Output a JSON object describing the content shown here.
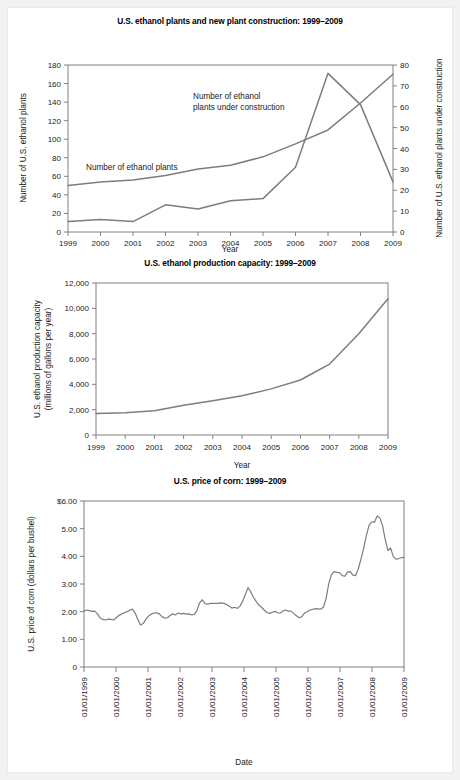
{
  "page": {
    "background": "#f2f2f2",
    "sheet_background": "#ffffff",
    "line_color": "#7d7d7d",
    "axis_color": "#808080"
  },
  "figures": [
    {
      "id": "plants",
      "title": "U.S. ethanol plants and new plant construction: 1999–2009",
      "xlabel": "Year",
      "ylabel_left": "Number of U.S. ethanol plants",
      "ylabel_right": "Number of U.S. ethanol plants under construction",
      "annotation_plants": "Number of ethanol plants",
      "annotation_construction_line1": "Number of ethanol",
      "annotation_construction_line2": "plants under construction",
      "xticks": [
        "1999",
        "2000",
        "2001",
        "2002",
        "2003",
        "2004",
        "2005",
        "2006",
        "2007",
        "2008",
        "2009"
      ],
      "yticks_left": [
        "0",
        "20",
        "40",
        "60",
        "80",
        "100",
        "120",
        "140",
        "160",
        "180"
      ],
      "yticks_right": [
        "0",
        "10",
        "20",
        "30",
        "40",
        "50",
        "60",
        "70",
        "80"
      ]
    },
    {
      "id": "capacity",
      "title": "U.S. ethanol production capacity: 1999–2009",
      "xlabel": "Year",
      "ylabel_line1": "U.S. ethanol production capacity",
      "ylabel_line2": "(millions of gallons per year)",
      "xticks": [
        "1999",
        "2000",
        "2001",
        "2002",
        "2003",
        "2004",
        "2005",
        "2006",
        "2007",
        "2008",
        "2009"
      ],
      "yticks": [
        "0",
        "2,000",
        "4,000",
        "6,000",
        "8,000",
        "10,000",
        "12,000"
      ]
    },
    {
      "id": "corn",
      "title": "U.S. price of corn: 1999–2009",
      "xlabel": "Date",
      "ylabel": "U.S. price of corn (dollars per bushel)",
      "xticks": [
        "01/01/1999",
        "01/01/2000",
        "01/01/2001",
        "01/01/2002",
        "01/01/2003",
        "01/01/2004",
        "01/01/2005",
        "01/01/2006",
        "01/01/2007",
        "01/01/2008",
        "01/01/2009"
      ],
      "yticks": [
        "0",
        "1.00",
        "2.00",
        "3.00",
        "4.00",
        "5.00",
        "$6.00"
      ]
    }
  ],
  "chart_data": [
    {
      "type": "line",
      "id": "plants",
      "title": "U.S. ethanol plants and new plant construction: 1999–2009",
      "xlabel": "Year",
      "ylabel": "Number of U.S. ethanol plants",
      "ylabel_secondary": "Number of U.S. ethanol plants under construction",
      "x": [
        1999,
        2000,
        2001,
        2002,
        2003,
        2004,
        2005,
        2006,
        2007,
        2008,
        2009
      ],
      "xlim": [
        1999,
        2009
      ],
      "ylim": [
        0,
        180
      ],
      "ylim_secondary": [
        0,
        80
      ],
      "grid": false,
      "legend": "in-plot annotations",
      "series": [
        {
          "name": "Number of ethanol plants",
          "axis": "left",
          "values": [
            50,
            54,
            56,
            61,
            68,
            72,
            81,
            95,
            110,
            139,
            170
          ]
        },
        {
          "name": "Number of ethanol plants under construction",
          "axis": "right",
          "values": [
            5,
            6,
            5,
            13,
            11,
            15,
            16,
            31,
            76,
            61,
            24
          ]
        }
      ]
    },
    {
      "type": "line",
      "id": "capacity",
      "title": "U.S. ethanol production capacity: 1999–2009",
      "xlabel": "Year",
      "ylabel": "U.S. ethanol production capacity (millions of gallons per year)",
      "x": [
        1999,
        2000,
        2001,
        2002,
        2003,
        2004,
        2005,
        2006,
        2007,
        2008,
        2009
      ],
      "xlim": [
        1999,
        2009
      ],
      "ylim": [
        0,
        12000
      ],
      "grid": false,
      "series": [
        {
          "name": "U.S. ethanol production capacity",
          "values": [
            1700,
            1750,
            1920,
            2350,
            2700,
            3100,
            3640,
            4340,
            5600,
            8000,
            10750
          ]
        }
      ]
    },
    {
      "type": "line",
      "id": "corn",
      "title": "U.S. price of corn: 1999–2009",
      "xlabel": "Date",
      "ylabel": "U.S. price of corn (dollars per bushel)",
      "xlim": [
        "01/01/1999",
        "01/01/2009"
      ],
      "ylim": [
        0,
        6
      ],
      "grid": false,
      "x_tick_labels": [
        "01/01/1999",
        "01/01/2000",
        "01/01/2001",
        "01/01/2002",
        "01/01/2003",
        "01/01/2004",
        "01/01/2005",
        "01/01/2006",
        "01/01/2007",
        "01/01/2008",
        "01/01/2009"
      ],
      "series": [
        {
          "name": "U.S. price of corn (monthly, dollars per bushel)",
          "values": [
            2.02,
            2.06,
            2.04,
            2.01,
            2.02,
            1.92,
            1.77,
            1.72,
            1.7,
            1.73,
            1.72,
            1.7,
            1.78,
            1.86,
            1.92,
            1.96,
            2.0,
            2.05,
            2.09,
            1.95,
            1.73,
            1.52,
            1.57,
            1.72,
            1.84,
            1.91,
            1.95,
            1.96,
            1.92,
            1.82,
            1.77,
            1.78,
            1.86,
            1.92,
            1.88,
            1.95,
            1.92,
            1.94,
            1.91,
            1.92,
            1.88,
            1.9,
            2.04,
            2.32,
            2.43,
            2.29,
            2.27,
            2.3,
            2.3,
            2.3,
            2.3,
            2.32,
            2.3,
            2.26,
            2.2,
            2.13,
            2.16,
            2.12,
            2.2,
            2.38,
            2.62,
            2.87,
            2.72,
            2.52,
            2.37,
            2.24,
            2.16,
            2.06,
            1.97,
            1.94,
            1.98,
            2.01,
            1.96,
            1.95,
            2.03,
            2.06,
            2.02,
            2.02,
            1.93,
            1.85,
            1.78,
            1.82,
            1.95,
            2.0,
            2.06,
            2.08,
            2.11,
            2.1,
            2.09,
            2.16,
            2.46,
            3.0,
            3.34,
            3.45,
            3.42,
            3.41,
            3.3,
            3.28,
            3.44,
            3.45,
            3.32,
            3.3,
            3.55,
            3.9,
            4.3,
            4.75,
            5.12,
            5.25,
            5.23,
            5.46,
            5.39,
            5.12,
            4.62,
            4.21,
            4.3,
            4.0,
            3.9,
            3.92,
            3.95,
            3.96
          ]
        }
      ]
    }
  ]
}
